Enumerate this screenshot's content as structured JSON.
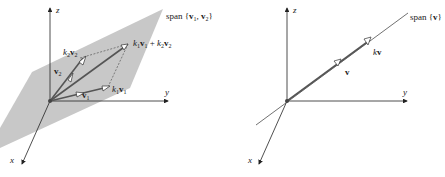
{
  "panel_a": {
    "axes": {
      "x": "x",
      "y": "y",
      "z": "z"
    },
    "span_label": {
      "prefix": "span ",
      "open": "{",
      "v1": "v",
      "sub1": "1",
      "comma": ", ",
      "v2": "v",
      "sub2": "2",
      "close": "}"
    },
    "vectors": {
      "v1": {
        "name": "v",
        "sub": "1"
      },
      "v2": {
        "name": "v",
        "sub": "2"
      },
      "k1v1": {
        "k": "k",
        "ksub": "1",
        "name": "v",
        "sub": "1"
      },
      "k2v2": {
        "k": "k",
        "ksub": "2",
        "name": "v",
        "sub": "2"
      },
      "sum": {
        "k1": "k",
        "k1sub": "1",
        "v1": "v",
        "v1sub": "1",
        "plus": " + ",
        "k2": "k",
        "k2sub": "2",
        "v2": "v",
        "v2sub": "2"
      }
    },
    "plane_color": "#c8c8c8"
  },
  "panel_b": {
    "axes": {
      "x": "x",
      "y": "y",
      "z": "z"
    },
    "span_label": {
      "prefix": "span ",
      "open": "{",
      "v": "v",
      "close": "}"
    },
    "vectors": {
      "v": {
        "name": "v"
      },
      "kv": {
        "k": "k",
        "name": "v"
      }
    }
  }
}
